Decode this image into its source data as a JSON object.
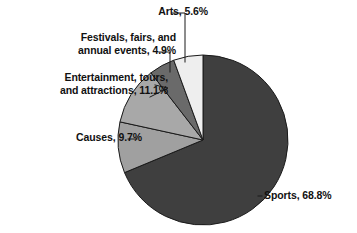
{
  "chart_data": {
    "type": "pie",
    "title": "",
    "subtitle": "",
    "xlabel": "",
    "ylabel": "",
    "legend_position": "none",
    "grid": false,
    "labels_inline": true,
    "unit": "%",
    "start_angle_deg": 0,
    "direction": "clockwise",
    "categories": [
      "Sports",
      "Causes",
      "Entertainment, tours, and attractions",
      "Festivals, fairs, and annual events",
      "Arts"
    ],
    "values": [
      68.8,
      9.7,
      11.1,
      4.9,
      5.6
    ],
    "slices": [
      {
        "name": "Sports",
        "value": 68.8,
        "value_text": "68.8%",
        "label_text": "Sports, 68.8%",
        "color": "#3f3f3f"
      },
      {
        "name": "Causes",
        "value": 9.7,
        "value_text": "9.7%",
        "label_text": "Causes, 9.7%",
        "color": "#a0a0a0"
      },
      {
        "name": "Entertainment, tours, and attractions",
        "value": 11.1,
        "value_text": "11.1%",
        "label_line_1": "Entertainment, tours,",
        "label_line_2": "and attractions, 11.1%",
        "color": "#a8a8a8"
      },
      {
        "name": "Festivals, fairs, and annual events",
        "value": 4.9,
        "value_text": "4.9%",
        "label_line_1": "Festivals, fairs, and",
        "label_line_2": "annual events, 4.9%",
        "color": "#6a6a6a"
      },
      {
        "name": "Arts",
        "value": 5.6,
        "value_text": "5.6%",
        "label_text": "Arts, 5.6%",
        "color": "#eeeeee"
      }
    ]
  },
  "colors": {
    "background": "#ffffff",
    "outline": "#1a1a1a",
    "text": "#111111",
    "sports": "#3f3f3f",
    "causes": "#a0a0a0",
    "entertainment": "#a8a8a8",
    "festivals": "#6a6a6a",
    "arts": "#eeeeee"
  }
}
